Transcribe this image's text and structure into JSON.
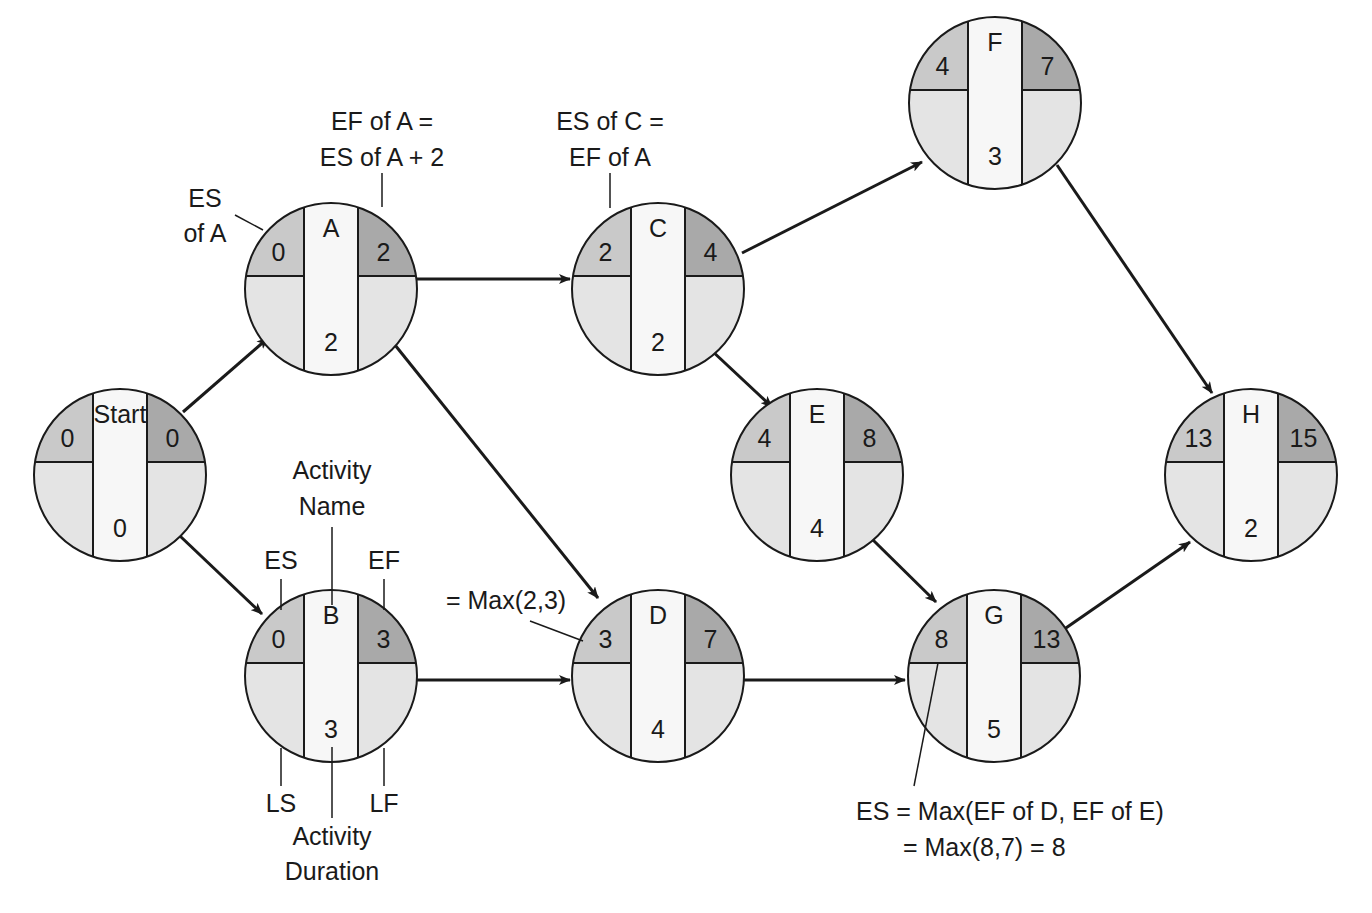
{
  "colors": {
    "es_fill": "#c9c9c9",
    "ef_fill": "#a9a9a9",
    "ls_lf_fill": "#e4e4e4",
    "center_fill": "#f7f7f7",
    "stroke": "#1a1a1a",
    "background": "#ffffff"
  },
  "geometry": {
    "radius": 86,
    "column_half_width": 27,
    "divider_offset": -13
  },
  "nodes": [
    {
      "id": "start",
      "name": "Start",
      "es": "0",
      "ef": "0",
      "duration": "0",
      "cx": 120,
      "cy": 475
    },
    {
      "id": "a",
      "name": "A",
      "es": "0",
      "ef": "2",
      "duration": "2",
      "cx": 331,
      "cy": 289
    },
    {
      "id": "b",
      "name": "B",
      "es": "0",
      "ef": "3",
      "duration": "3",
      "cx": 331,
      "cy": 676
    },
    {
      "id": "c",
      "name": "C",
      "es": "2",
      "ef": "4",
      "duration": "2",
      "cx": 658,
      "cy": 289
    },
    {
      "id": "d",
      "name": "D",
      "es": "3",
      "ef": "7",
      "duration": "4",
      "cx": 658,
      "cy": 676
    },
    {
      "id": "e",
      "name": "E",
      "es": "4",
      "ef": "8",
      "duration": "4",
      "cx": 817,
      "cy": 475
    },
    {
      "id": "f",
      "name": "F",
      "es": "4",
      "ef": "7",
      "duration": "3",
      "cx": 995,
      "cy": 103
    },
    {
      "id": "g",
      "name": "G",
      "es": "8",
      "ef": "13",
      "duration": "5",
      "cx": 994,
      "cy": 676
    },
    {
      "id": "h",
      "name": "H",
      "es": "13",
      "ef": "15",
      "duration": "2",
      "cx": 1251,
      "cy": 475
    }
  ],
  "edges": [
    {
      "from": "start",
      "to": "a",
      "x1": 183,
      "y1": 412,
      "x2": 268,
      "y2": 338
    },
    {
      "from": "start",
      "to": "b",
      "x1": 180,
      "y1": 536,
      "x2": 262,
      "y2": 614
    },
    {
      "from": "a",
      "to": "c",
      "x1": 417,
      "y1": 279,
      "x2": 570,
      "y2": 279
    },
    {
      "from": "a",
      "to": "d",
      "x1": 395,
      "y1": 345,
      "x2": 598,
      "y2": 598
    },
    {
      "from": "b",
      "to": "d",
      "x1": 417,
      "y1": 680,
      "x2": 570,
      "y2": 680
    },
    {
      "from": "c",
      "to": "f",
      "x1": 742,
      "y1": 253,
      "x2": 922,
      "y2": 162
    },
    {
      "from": "c",
      "to": "e",
      "x1": 710,
      "y1": 349,
      "x2": 772,
      "y2": 407
    },
    {
      "from": "e",
      "to": "g",
      "x1": 873,
      "y1": 540,
      "x2": 936,
      "y2": 602
    },
    {
      "from": "d",
      "to": "g",
      "x1": 744,
      "y1": 680,
      "x2": 905,
      "y2": 680
    },
    {
      "from": "f",
      "to": "h",
      "x1": 1057,
      "y1": 165,
      "x2": 1212,
      "y2": 393
    },
    {
      "from": "g",
      "to": "h",
      "x1": 1063,
      "y1": 630,
      "x2": 1190,
      "y2": 542
    }
  ],
  "annotations": {
    "es_of_a": {
      "lines": [
        "ES",
        "of A"
      ]
    },
    "ef_of_a": {
      "lines": [
        "EF of A =",
        "ES of A + 2"
      ]
    },
    "es_of_c": {
      "lines": [
        "ES of C =",
        "EF of A"
      ]
    },
    "legend": {
      "activity_name": [
        "Activity",
        "Name"
      ],
      "es": "ES",
      "ef": "EF",
      "ls": "LS",
      "lf": "LF",
      "activity_duration": [
        "Activity",
        "Duration"
      ]
    },
    "max_d": "= Max(2,3)",
    "es_g": [
      "ES = Max(EF of D, EF of E)",
      "= Max(8,7) = 8"
    ]
  }
}
